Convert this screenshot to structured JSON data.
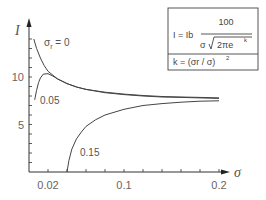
{
  "chart_data": {
    "type": "line",
    "title": "",
    "xlabel": "σ",
    "ylabel": "I",
    "xlim": [
      0,
      0.2
    ],
    "ylim": [
      0,
      15
    ],
    "x_ticks": [
      0.02,
      0.04,
      0.06,
      0.08,
      0.1,
      0.12,
      0.14,
      0.16,
      0.18,
      0.2
    ],
    "x_tick_labels": [
      {
        "value": 0.02,
        "label": "0.02"
      },
      {
        "value": 0.1,
        "label": "0.1"
      },
      {
        "value": 0.2,
        "label": "0.2"
      }
    ],
    "y_ticks": [
      1,
      2,
      3,
      4,
      5,
      6,
      7,
      8,
      9,
      10,
      11,
      12,
      13,
      14
    ],
    "y_tick_labels": [
      {
        "value": 5,
        "label": "5"
      },
      {
        "value": 10,
        "label": "10"
      }
    ],
    "grid": false,
    "series": [
      {
        "name": "σr = 0",
        "label": "σr = 0",
        "x": [
          0.005,
          0.008,
          0.012,
          0.016,
          0.02,
          0.03,
          0.04,
          0.05,
          0.06,
          0.08,
          0.1,
          0.12,
          0.14,
          0.16,
          0.18,
          0.2
        ],
        "y": [
          14.0,
          13.0,
          12.0,
          11.2,
          10.6,
          9.8,
          9.3,
          8.95,
          8.7,
          8.4,
          8.2,
          8.05,
          7.95,
          7.9,
          7.85,
          7.8
        ]
      },
      {
        "name": "σr = 0.05",
        "label": "0.05",
        "x": [
          0.006,
          0.008,
          0.01,
          0.012,
          0.015,
          0.02,
          0.025,
          0.03,
          0.04,
          0.05,
          0.06,
          0.08,
          0.1,
          0.12,
          0.14,
          0.16,
          0.18,
          0.2
        ],
        "y": [
          7.6,
          8.6,
          9.4,
          9.9,
          10.3,
          10.35,
          10.1,
          9.8,
          9.3,
          8.95,
          8.7,
          8.35,
          8.15,
          8.0,
          7.9,
          7.85,
          7.8,
          7.75
        ]
      },
      {
        "name": "σr = 0.15",
        "label": "0.15",
        "x": [
          0.04,
          0.042,
          0.045,
          0.05,
          0.055,
          0.06,
          0.07,
          0.08,
          0.1,
          0.12,
          0.14,
          0.16,
          0.18,
          0.2
        ],
        "y": [
          0.0,
          1.2,
          2.4,
          3.5,
          4.2,
          4.8,
          5.5,
          6.0,
          6.6,
          7.0,
          7.2,
          7.35,
          7.45,
          7.5
        ]
      }
    ],
    "annotations": {
      "formula_line1_lhs": "I = Ib",
      "formula_numerator": "100",
      "formula_denominator_sigma": "σ",
      "formula_denominator_root": "2πe",
      "formula_denominator_exp": "k",
      "formula_line2": "k = (σr / σ)",
      "formula_line2_exp": "2"
    }
  }
}
